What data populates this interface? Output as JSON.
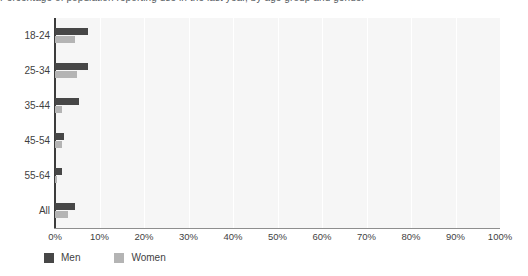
{
  "title_clipped": "Percentage of population reporting use in the last year, by age group and gender",
  "chart_data": {
    "type": "bar",
    "orientation": "horizontal",
    "title": "",
    "xlabel": "",
    "ylabel": "",
    "categories": [
      "18-24",
      "25-34",
      "35-44",
      "45-54",
      "55-64",
      "All"
    ],
    "series": [
      {
        "name": "Men",
        "color": "#474747",
        "values": [
          7.5,
          7.5,
          5.5,
          2.0,
          1.5,
          4.5
        ]
      },
      {
        "name": "Women",
        "color": "#b4b4b4",
        "values": [
          4.5,
          5.0,
          1.5,
          1.5,
          0.5,
          3.0
        ]
      }
    ],
    "xlim": [
      0,
      100
    ],
    "xticks": [
      "0%",
      "10%",
      "20%",
      "30%",
      "40%",
      "50%",
      "60%",
      "70%",
      "80%",
      "90%",
      "100%"
    ],
    "xtick_values": [
      0,
      10,
      20,
      30,
      40,
      50,
      60,
      70,
      80,
      90,
      100
    ],
    "grid": true,
    "grid_axis": "x",
    "legend_position": "bottom-left",
    "plot_background": "#f6f6f6",
    "gridline_color": "#ffffff",
    "axis_color": "#3c3c3c"
  },
  "legend": {
    "items": [
      {
        "label": "Men",
        "color": "#474747"
      },
      {
        "label": "Women",
        "color": "#b4b4b4"
      }
    ]
  }
}
